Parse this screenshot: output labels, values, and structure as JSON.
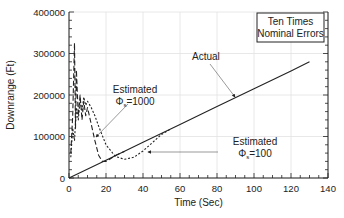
{
  "chart_data": {
    "type": "line",
    "title": "",
    "xlabel": "Time (Sec)",
    "ylabel": "Downrange (Ft)",
    "xlim": [
      0,
      140
    ],
    "ylim": [
      0,
      400000
    ],
    "x_ticks": [
      "0",
      "20",
      "40",
      "60",
      "80",
      "100",
      "120",
      "140"
    ],
    "y_ticks": [
      "0",
      "100000",
      "200000",
      "300000",
      "400000"
    ],
    "grid": true,
    "legend_box": {
      "line1": "Ten Times",
      "line2": "Nominal Errors"
    },
    "annotations": [
      {
        "text": "Actual",
        "target_series": "Actual"
      },
      {
        "text_line1": "Estimated",
        "symbol": "Φ",
        "subscript": "s",
        "value": "=1000",
        "target_series": "Estimated Φs=1000"
      },
      {
        "text_line1": "Estimated",
        "symbol": "Φ",
        "subscript": "s",
        "value": "=100",
        "target_series": "Estimated Φs=100"
      }
    ],
    "series": [
      {
        "name": "Actual",
        "style": "solid",
        "x": [
          0,
          20,
          40,
          60,
          80,
          100,
          120,
          130
        ],
        "y": [
          0,
          43000,
          86000,
          129000,
          172000,
          215000,
          258000,
          280000
        ]
      },
      {
        "name": "Estimated Φs=1000",
        "style": "long-dash",
        "x": [
          1,
          2,
          3,
          3.5,
          4,
          5,
          6,
          7,
          8,
          9,
          10,
          12,
          14,
          16,
          18,
          20,
          22,
          25,
          30
        ],
        "y": [
          60000,
          150000,
          325000,
          120000,
          260000,
          150000,
          200000,
          140000,
          185000,
          150000,
          170000,
          130000,
          90000,
          55000,
          40000,
          40000,
          45000,
          54000,
          64000
        ]
      },
      {
        "name": "Estimated Φs=100",
        "style": "short-dash",
        "x": [
          1,
          2,
          3,
          4,
          5,
          6,
          7,
          8,
          9,
          10,
          12,
          14,
          16,
          20,
          25,
          30,
          35,
          40,
          45,
          50,
          55
        ],
        "y": [
          50000,
          120000,
          90000,
          170000,
          140000,
          190000,
          160000,
          195000,
          175000,
          185000,
          170000,
          150000,
          125000,
          80000,
          52000,
          45000,
          50000,
          65000,
          85000,
          105000,
          118000
        ]
      }
    ]
  }
}
